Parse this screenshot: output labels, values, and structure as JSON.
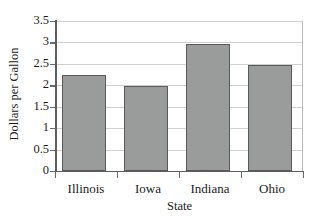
{
  "chart_data": {
    "type": "bar",
    "title": "",
    "categories": [
      "Illinois",
      "Iowa",
      "Indiana",
      "Ohio"
    ],
    "values": [
      2.24,
      1.98,
      2.97,
      2.47
    ],
    "series": [
      {
        "name": "Dollars per Gallon",
        "values": [
          2.24,
          1.98,
          2.97,
          2.47
        ]
      }
    ],
    "xlabel": "State",
    "ylabel": "Dollars per Gallon",
    "ylim": [
      0,
      3.5
    ],
    "ytick_labels": [
      "3.5",
      "3",
      "2.5",
      "2",
      "1.5",
      "1",
      "0.5",
      "0"
    ],
    "ytick_values": [
      3.5,
      3,
      2.5,
      2,
      1.5,
      1,
      0.5,
      0
    ],
    "grid": true,
    "grid_axis": "y",
    "legend": false,
    "legend_position": "none",
    "bar_fill_color": "#9a9b9b",
    "bar_border_color": "#5a5a5a",
    "gridline_color": "#cfcfcf",
    "axis_color": "#5d5d5d",
    "background_color": "#ffffff"
  }
}
